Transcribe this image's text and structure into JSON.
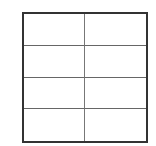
{
  "table": {
    "rows": 4,
    "columns": 2,
    "cells": [
      [
        "",
        ""
      ],
      [
        "",
        ""
      ],
      [
        "",
        ""
      ],
      [
        "",
        ""
      ]
    ],
    "border_color": "#333333",
    "inner_line_color": "#777777"
  }
}
